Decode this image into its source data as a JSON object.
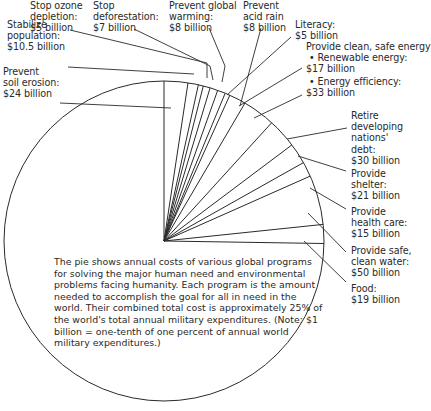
{
  "chart_data": {
    "type": "pie",
    "title": "",
    "unit": "billion USD",
    "full_circle_represents": "annual world military expenditures (~$1000 billion)",
    "start_angle": "12 o'clock, clockwise",
    "categories": [
      "Prevent soil erosion",
      "Stabilize population",
      "Stop ozone depletion",
      "Stop deforestation",
      "Prevent global warming",
      "Prevent acid rain",
      "Literacy",
      "Renewable energy",
      "Energy efficiency",
      "Retire developing nations' debt",
      "Provide shelter",
      "Provide health care",
      "Provide safe, clean water",
      "Food"
    ],
    "values": [
      24,
      10.5,
      5,
      7,
      8,
      8,
      5,
      17,
      33,
      30,
      21,
      15,
      50,
      19
    ],
    "total_circle_value": 1000,
    "center": [
      164,
      241
    ],
    "radius": 160
  },
  "labels": [
    {
      "id": "soil",
      "text": "Prevent\nsoil erosion:\n$24 billion",
      "x": 3,
      "y": 66
    },
    {
      "id": "population",
      "text": "Stabilize\npopulation:\n$10.5 billion",
      "x": 7,
      "y": 19
    },
    {
      "id": "ozone",
      "text": "Stop ozone\ndepletion:\n$5 billion",
      "x": 30,
      "y": 0
    },
    {
      "id": "deforestation",
      "text": "Stop\ndeforestation:\n$7 billion",
      "x": 93,
      "y": 0
    },
    {
      "id": "warming",
      "text": "Prevent global\nwarming:\n$8 billion",
      "x": 169,
      "y": 0
    },
    {
      "id": "acidrain",
      "text": "Prevent\nacid rain\n$8 billion",
      "x": 243,
      "y": 0
    },
    {
      "id": "literacy",
      "text": "Literacy:\n$5 billion",
      "x": 295,
      "y": 19
    },
    {
      "id": "energy",
      "text": "Provide clean, safe energy\n • Renewable energy:\n$17 billion",
      "x": 306,
      "y": 41
    },
    {
      "id": "efficiency",
      "text": " • Energy efficiency:\n$33 billion",
      "x": 306,
      "y": 76
    },
    {
      "id": "debt",
      "text": "Retire\ndeveloping\nnations'\ndebt:\n$30 billion",
      "x": 351,
      "y": 110
    },
    {
      "id": "shelter",
      "text": "Provide\nshelter:\n$21 billion",
      "x": 351,
      "y": 168
    },
    {
      "id": "health",
      "text": "Provide\nhealth care:\n$15 billion",
      "x": 351,
      "y": 206
    },
    {
      "id": "water",
      "text": "Provide safe,\nclean water:\n$50 billion",
      "x": 351,
      "y": 245
    },
    {
      "id": "food",
      "text": "Food:\n$19 billion",
      "x": 351,
      "y": 283
    }
  ],
  "leaders": [
    [
      [
        60,
        103
      ],
      [
        171,
        108
      ]
    ],
    [
      [
        68,
        67
      ],
      [
        194,
        74
      ]
    ],
    [
      [
        70,
        30
      ],
      [
        207,
        63
      ],
      [
        207,
        78
      ]
    ],
    [
      [
        134,
        29
      ],
      [
        210,
        66
      ],
      [
        213,
        80
      ]
    ],
    [
      [
        209,
        28
      ],
      [
        225,
        66
      ],
      [
        222,
        82
      ]
    ],
    [
      [
        261,
        28
      ],
      [
        240,
        106
      ]
    ],
    [
      [
        291,
        37
      ],
      [
        227,
        95
      ]
    ],
    [
      [
        302,
        68
      ],
      [
        239,
        106
      ]
    ],
    [
      [
        302,
        95
      ],
      [
        254,
        118
      ]
    ],
    [
      [
        347,
        128
      ],
      [
        287,
        139
      ]
    ],
    [
      [
        346,
        171
      ],
      [
        298,
        156
      ]
    ],
    [
      [
        346,
        209
      ],
      [
        310,
        188
      ]
    ],
    [
      [
        346,
        252
      ],
      [
        308,
        213
      ]
    ],
    [
      [
        346,
        282
      ],
      [
        304,
        241
      ]
    ]
  ],
  "note": {
    "text": "The pie shows annual costs of various global programs for solving the major human need and environmental problems facing humanity. Each program is the amount needed to accomplish the goal for all in need in the world. Their combined total cost is approximately 25% of the world's total annual military expenditures. (Note: $1 billion = one-tenth of one percent of annual world military expenditures.)"
  },
  "colors": {
    "line": "#2a2a2a",
    "background": "#ffffff",
    "text": "#2a2a2a"
  }
}
